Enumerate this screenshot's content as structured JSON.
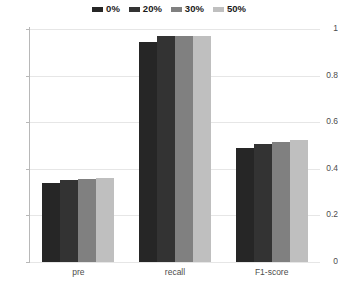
{
  "chart_data": {
    "type": "bar",
    "title": "",
    "subtitle": "",
    "xlabel": "",
    "ylabel": "",
    "categories": [
      "pre",
      "recall",
      "F1-score"
    ],
    "series": [
      {
        "name": "0%",
        "color": "#262626",
        "values": [
          0.34,
          0.945,
          0.49
        ]
      },
      {
        "name": "20%",
        "color": "#333333",
        "values": [
          0.35,
          0.97,
          0.505
        ]
      },
      {
        "name": "30%",
        "color": "#808080",
        "values": [
          0.355,
          0.97,
          0.515
        ]
      },
      {
        "name": "50%",
        "color": "#bfbfbf",
        "values": [
          0.36,
          0.97,
          0.525
        ]
      }
    ],
    "ylim": [
      0,
      1
    ],
    "yticks": [
      0,
      0.2,
      0.4,
      0.6,
      0.8,
      1
    ],
    "ytick_labels": [
      "0",
      "0.2",
      "0.4",
      "0.6",
      "0.8",
      "1"
    ],
    "grid": true,
    "legend_position": "top-center",
    "background_color": "#ffffff",
    "axis_color": "#b8b8b8",
    "gridline_color": "#e6e6e6",
    "tick_label_color": "#4d4d4d"
  }
}
